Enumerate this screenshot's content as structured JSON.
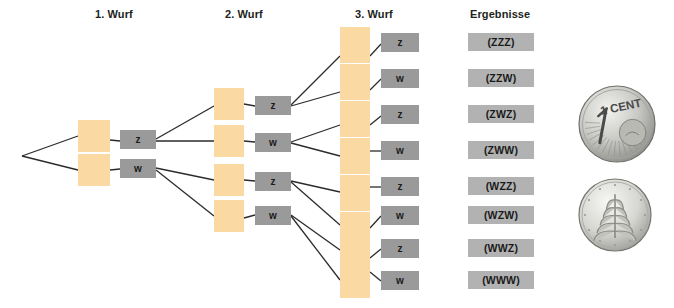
{
  "diagram": {
    "title_columns": [
      {
        "label": "1. Wurf",
        "x": 95,
        "y": 8
      },
      {
        "label": "2. Wurf",
        "x": 225,
        "y": 8
      },
      {
        "label": "3. Wurf",
        "x": 355,
        "y": 8
      },
      {
        "label": "Ergebnisse",
        "x": 470,
        "y": 8
      }
    ],
    "colors": {
      "orange": "#fbd9a3",
      "gray_node": "#9a9a9a",
      "gray_result": "#b2b2b2",
      "edge": "#2b2b2b",
      "text": "#231f20",
      "background": "#ffffff"
    },
    "root": {
      "x": 22,
      "y": 156
    },
    "level1": {
      "orange": [
        {
          "x": 78,
          "y": 120,
          "w": 32,
          "h": 32
        },
        {
          "x": 78,
          "y": 154,
          "w": 32,
          "h": 32
        }
      ],
      "labels": [
        {
          "text": "z",
          "x": 120,
          "y": 130,
          "w": 36,
          "h": 19
        },
        {
          "text": "w",
          "x": 120,
          "y": 159,
          "w": 36,
          "h": 19
        }
      ]
    },
    "level2": {
      "orange": [
        {
          "x": 214,
          "y": 88,
          "w": 30,
          "h": 32
        },
        {
          "x": 214,
          "y": 125,
          "w": 30,
          "h": 32
        },
        {
          "x": 214,
          "y": 164,
          "w": 30,
          "h": 32
        },
        {
          "x": 214,
          "y": 200,
          "w": 30,
          "h": 32
        }
      ],
      "labels": [
        {
          "text": "z",
          "x": 255,
          "y": 96,
          "w": 36,
          "h": 19
        },
        {
          "text": "w",
          "x": 255,
          "y": 133,
          "w": 36,
          "h": 19
        },
        {
          "text": "z",
          "x": 255,
          "y": 172,
          "w": 36,
          "h": 19
        },
        {
          "text": "w",
          "x": 255,
          "y": 206,
          "w": 36,
          "h": 19
        }
      ]
    },
    "level3": {
      "orange": [
        {
          "x": 340,
          "y": 27,
          "w": 30,
          "h": 36
        },
        {
          "x": 340,
          "y": 64,
          "w": 30,
          "h": 36
        },
        {
          "x": 340,
          "y": 101,
          "w": 30,
          "h": 36
        },
        {
          "x": 340,
          "y": 138,
          "w": 30,
          "h": 36
        },
        {
          "x": 340,
          "y": 175,
          "w": 30,
          "h": 36
        },
        {
          "x": 340,
          "y": 212,
          "w": 30,
          "h": 36
        },
        {
          "x": 340,
          "y": 232,
          "w": 30,
          "h": 36
        },
        {
          "x": 340,
          "y": 262,
          "w": 30,
          "h": 36
        }
      ],
      "labels": [
        {
          "text": "z",
          "x": 381,
          "y": 33,
          "w": 38,
          "h": 19
        },
        {
          "text": "w",
          "x": 381,
          "y": 69,
          "w": 38,
          "h": 19
        },
        {
          "text": "z",
          "x": 381,
          "y": 105,
          "w": 38,
          "h": 19
        },
        {
          "text": "w",
          "x": 381,
          "y": 141,
          "w": 38,
          "h": 19
        },
        {
          "text": "z",
          "x": 381,
          "y": 177,
          "w": 38,
          "h": 19
        },
        {
          "text": "w",
          "x": 381,
          "y": 206,
          "w": 38,
          "h": 19
        },
        {
          "text": "z",
          "x": 381,
          "y": 239,
          "w": 38,
          "h": 19
        },
        {
          "text": "w",
          "x": 381,
          "y": 271,
          "w": 38,
          "h": 19
        }
      ]
    },
    "results": [
      {
        "text": "(ZZZ)",
        "x": 468,
        "y": 33,
        "w": 66,
        "h": 18
      },
      {
        "text": "(ZZW)",
        "x": 468,
        "y": 69,
        "w": 66,
        "h": 18
      },
      {
        "text": "(ZWZ)",
        "x": 468,
        "y": 105,
        "w": 66,
        "h": 18
      },
      {
        "text": "(ZWW)",
        "x": 468,
        "y": 141,
        "w": 66,
        "h": 18
      },
      {
        "text": "(WZZ)",
        "x": 468,
        "y": 177,
        "w": 66,
        "h": 18
      },
      {
        "text": "(WZW)",
        "x": 468,
        "y": 206,
        "w": 66,
        "h": 18
      },
      {
        "text": "(WWZ)",
        "x": 468,
        "y": 239,
        "w": 66,
        "h": 18
      },
      {
        "text": "(WWW)",
        "x": 468,
        "y": 271,
        "w": 66,
        "h": 18
      }
    ],
    "edges": [
      {
        "x1": 22,
        "y1": 156,
        "x2": 78,
        "y2": 136
      },
      {
        "x1": 22,
        "y1": 156,
        "x2": 78,
        "y2": 170
      },
      {
        "x1": 110,
        "y1": 140,
        "x2": 120,
        "y2": 141
      },
      {
        "x1": 110,
        "y1": 170,
        "x2": 120,
        "y2": 169
      },
      {
        "x1": 156,
        "y1": 139,
        "x2": 214,
        "y2": 106
      },
      {
        "x1": 156,
        "y1": 141,
        "x2": 214,
        "y2": 141
      },
      {
        "x1": 156,
        "y1": 168,
        "x2": 214,
        "y2": 180
      },
      {
        "x1": 156,
        "y1": 170,
        "x2": 214,
        "y2": 216
      },
      {
        "x1": 244,
        "y1": 104,
        "x2": 255,
        "y2": 106
      },
      {
        "x1": 244,
        "y1": 141,
        "x2": 255,
        "y2": 142
      },
      {
        "x1": 244,
        "y1": 180,
        "x2": 255,
        "y2": 181
      },
      {
        "x1": 244,
        "y1": 218,
        "x2": 255,
        "y2": 215
      },
      {
        "x1": 291,
        "y1": 105,
        "x2": 340,
        "y2": 56
      },
      {
        "x1": 291,
        "y1": 106,
        "x2": 340,
        "y2": 92
      },
      {
        "x1": 291,
        "y1": 142,
        "x2": 340,
        "y2": 125
      },
      {
        "x1": 291,
        "y1": 143,
        "x2": 340,
        "y2": 156
      },
      {
        "x1": 291,
        "y1": 181,
        "x2": 340,
        "y2": 192
      },
      {
        "x1": 291,
        "y1": 182,
        "x2": 340,
        "y2": 225
      },
      {
        "x1": 291,
        "y1": 215,
        "x2": 340,
        "y2": 250
      },
      {
        "x1": 291,
        "y1": 216,
        "x2": 340,
        "y2": 280
      },
      {
        "x1": 370,
        "y1": 56,
        "x2": 381,
        "y2": 44
      },
      {
        "x1": 370,
        "y1": 90,
        "x2": 381,
        "y2": 79
      },
      {
        "x1": 370,
        "y1": 125,
        "x2": 381,
        "y2": 116
      },
      {
        "x1": 370,
        "y1": 151,
        "x2": 381,
        "y2": 151
      },
      {
        "x1": 370,
        "y1": 187,
        "x2": 381,
        "y2": 187
      },
      {
        "x1": 370,
        "y1": 228,
        "x2": 381,
        "y2": 216
      },
      {
        "x1": 370,
        "y1": 258,
        "x2": 381,
        "y2": 249
      },
      {
        "x1": 370,
        "y1": 272,
        "x2": 381,
        "y2": 281
      }
    ]
  },
  "coins": [
    {
      "name": "euro-1-cent-value-side",
      "label": "1 CENT",
      "x": 578,
      "y": 85,
      "size": 78
    },
    {
      "name": "euro-1-cent-oak-leaf-side",
      "label": "",
      "x": 578,
      "y": 178,
      "size": 74
    }
  ]
}
